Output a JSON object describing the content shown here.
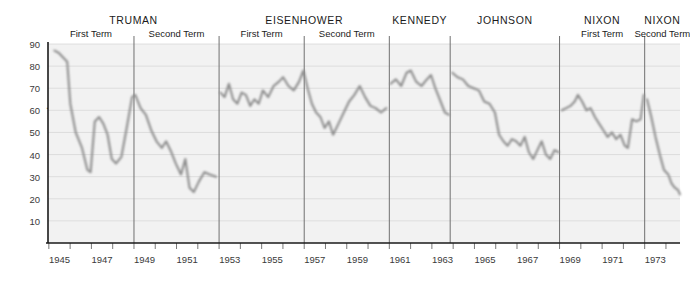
{
  "axis": {
    "ylabel": "Percentage approving",
    "yticks": [
      90,
      80,
      70,
      60,
      50,
      40,
      30,
      20,
      10
    ],
    "xticks": [
      "1945",
      "1947",
      "1949",
      "1951",
      "1953",
      "1955",
      "1957",
      "1959",
      "1961",
      "1963",
      "1965",
      "1967",
      "1969",
      "1971",
      "1973"
    ],
    "ylim": [
      0,
      90
    ],
    "xlim": [
      1945.0,
      1974.7
    ],
    "grid": true
  },
  "presidents": [
    {
      "name": "TRUMAN",
      "terms": [
        "First Term",
        "Second Term"
      ],
      "start": 1945.0,
      "end": 1953.04,
      "split": 1949.04
    },
    {
      "name": "EISENHOWER",
      "terms": [
        "First Term",
        "Second Term"
      ],
      "start": 1953.04,
      "end": 1961.04,
      "split": 1957.04
    },
    {
      "name": "KENNEDY",
      "terms": [],
      "start": 1961.04,
      "end": 1963.9,
      "split": null
    },
    {
      "name": "JOHNSON",
      "terms": [],
      "start": 1963.9,
      "end": 1969.04,
      "split": null
    },
    {
      "name": "NIXON",
      "terms": [
        "First Term"
      ],
      "start": 1969.04,
      "end": 1973.04,
      "split": null
    },
    {
      "name": "NIXON",
      "terms": [
        "Second Term"
      ],
      "start": 1973.04,
      "end": 1974.7,
      "split": null
    }
  ],
  "colors": {
    "line": "#8d8d8d",
    "plot_background": "#f2f2f2",
    "gridline": "#d8d8d8",
    "divider": "#707070",
    "axis": "#1a1a1a",
    "text": "#1b1b1b"
  },
  "chart_data": {
    "type": "line",
    "title": "",
    "xlabel": "",
    "ylabel": "Percentage approving",
    "ylim": [
      0,
      90
    ],
    "xlim": [
      1945.0,
      1974.7
    ],
    "grid": true,
    "legend": "none",
    "series": [
      {
        "name": "Presidential approval rating",
        "points": [
          [
            1945.3,
            87
          ],
          [
            1945.5,
            86
          ],
          [
            1945.7,
            84
          ],
          [
            1945.9,
            82
          ],
          [
            1946.05,
            63
          ],
          [
            1946.3,
            50
          ],
          [
            1946.6,
            43
          ],
          [
            1946.85,
            33
          ],
          [
            1947.0,
            32
          ],
          [
            1947.2,
            55
          ],
          [
            1947.4,
            57
          ],
          [
            1947.6,
            54
          ],
          [
            1947.8,
            49
          ],
          [
            1948.0,
            38
          ],
          [
            1948.2,
            36
          ],
          [
            1948.45,
            39
          ],
          [
            1948.7,
            52
          ],
          [
            1948.95,
            66
          ],
          [
            1949.1,
            67
          ],
          [
            1949.35,
            61
          ],
          [
            1949.6,
            58
          ],
          [
            1949.85,
            51
          ],
          [
            1950.1,
            46
          ],
          [
            1950.35,
            43
          ],
          [
            1950.55,
            46
          ],
          [
            1950.8,
            41
          ],
          [
            1951.0,
            36
          ],
          [
            1951.25,
            31
          ],
          [
            1951.45,
            38
          ],
          [
            1951.65,
            25
          ],
          [
            1951.85,
            23
          ],
          [
            1952.1,
            28
          ],
          [
            1952.35,
            32
          ],
          [
            1952.6,
            31
          ],
          [
            1952.9,
            30
          ],
          [
            1953.1,
            68
          ],
          [
            1953.3,
            66
          ],
          [
            1953.5,
            72
          ],
          [
            1953.7,
            65
          ],
          [
            1953.9,
            63
          ],
          [
            1954.1,
            68
          ],
          [
            1954.3,
            67
          ],
          [
            1954.5,
            62
          ],
          [
            1954.7,
            65
          ],
          [
            1954.9,
            63
          ],
          [
            1955.1,
            69
          ],
          [
            1955.35,
            66
          ],
          [
            1955.6,
            71
          ],
          [
            1955.85,
            73
          ],
          [
            1956.05,
            75
          ],
          [
            1956.3,
            71
          ],
          [
            1956.55,
            69
          ],
          [
            1956.8,
            73
          ],
          [
            1957.0,
            78
          ],
          [
            1957.2,
            70
          ],
          [
            1957.4,
            63
          ],
          [
            1957.6,
            59
          ],
          [
            1957.8,
            57
          ],
          [
            1958.0,
            52
          ],
          [
            1958.2,
            55
          ],
          [
            1958.4,
            49
          ],
          [
            1958.65,
            54
          ],
          [
            1958.9,
            59
          ],
          [
            1959.15,
            64
          ],
          [
            1959.4,
            67
          ],
          [
            1959.65,
            71
          ],
          [
            1959.9,
            66
          ],
          [
            1960.15,
            62
          ],
          [
            1960.4,
            61
          ],
          [
            1960.65,
            59
          ],
          [
            1960.9,
            61
          ],
          [
            1961.1,
            72
          ],
          [
            1961.35,
            74
          ],
          [
            1961.6,
            71
          ],
          [
            1961.85,
            77
          ],
          [
            1962.05,
            78
          ],
          [
            1962.3,
            73
          ],
          [
            1962.55,
            71
          ],
          [
            1962.8,
            74
          ],
          [
            1963.0,
            76
          ],
          [
            1963.2,
            70
          ],
          [
            1963.45,
            64
          ],
          [
            1963.65,
            59
          ],
          [
            1963.85,
            58
          ],
          [
            1964.0,
            77
          ],
          [
            1964.25,
            75
          ],
          [
            1964.5,
            74
          ],
          [
            1964.75,
            71
          ],
          [
            1965.0,
            70
          ],
          [
            1965.25,
            69
          ],
          [
            1965.5,
            64
          ],
          [
            1965.75,
            63
          ],
          [
            1966.0,
            59
          ],
          [
            1966.2,
            49
          ],
          [
            1966.4,
            46
          ],
          [
            1966.6,
            44
          ],
          [
            1966.8,
            47
          ],
          [
            1967.0,
            46
          ],
          [
            1967.2,
            44
          ],
          [
            1967.4,
            48
          ],
          [
            1967.6,
            41
          ],
          [
            1967.8,
            38
          ],
          [
            1968.0,
            42
          ],
          [
            1968.2,
            46
          ],
          [
            1968.4,
            40
          ],
          [
            1968.6,
            38
          ],
          [
            1968.8,
            42
          ],
          [
            1969.0,
            41
          ],
          [
            1969.15,
            60
          ],
          [
            1969.35,
            61
          ],
          [
            1969.55,
            62
          ],
          [
            1969.75,
            64
          ],
          [
            1969.9,
            67
          ],
          [
            1970.1,
            64
          ],
          [
            1970.3,
            60
          ],
          [
            1970.5,
            61
          ],
          [
            1970.7,
            57
          ],
          [
            1970.9,
            54
          ],
          [
            1971.1,
            51
          ],
          [
            1971.3,
            48
          ],
          [
            1971.5,
            50
          ],
          [
            1971.7,
            47
          ],
          [
            1971.9,
            49
          ],
          [
            1972.1,
            44
          ],
          [
            1972.25,
            43
          ],
          [
            1972.45,
            56
          ],
          [
            1972.65,
            55
          ],
          [
            1972.85,
            56
          ],
          [
            1973.0,
            67
          ],
          [
            1973.15,
            65
          ],
          [
            1973.35,
            57
          ],
          [
            1973.55,
            48
          ],
          [
            1973.75,
            40
          ],
          [
            1973.95,
            33
          ],
          [
            1974.15,
            31
          ],
          [
            1974.3,
            27
          ],
          [
            1974.45,
            25
          ],
          [
            1974.6,
            24
          ],
          [
            1974.7,
            22
          ]
        ]
      }
    ]
  }
}
